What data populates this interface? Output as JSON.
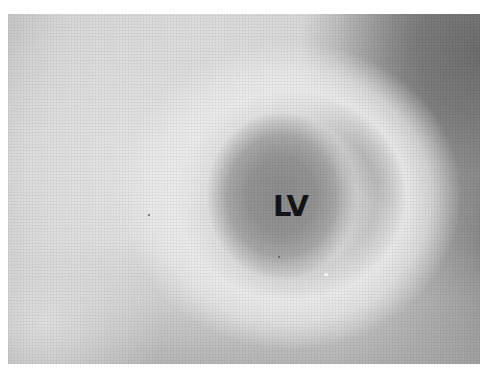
{
  "image": {
    "description": "Grayscale cardiac image cross-section with labeled left ventricle cavity",
    "labels": [
      {
        "text": "LV",
        "meaning": "left ventricle"
      }
    ]
  }
}
